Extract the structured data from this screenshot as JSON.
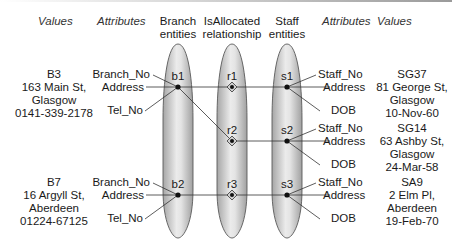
{
  "headers": {
    "left_values": "Values",
    "left_attributes": "Attributes",
    "branch_entities_line1": "Branch",
    "branch_entities_line2": "entities",
    "relationship_line1": "IsAllocated",
    "relationship_line2": "relationship",
    "staff_entities_line1": "Staff",
    "staff_entities_line2": "entities",
    "right_attributes": "Attributes",
    "right_values": "Values"
  },
  "branches": [
    {
      "id": "b1",
      "attributes": [
        "Branch_No",
        "Address",
        "Tel_No"
      ],
      "values": [
        "B3",
        "163 Main St,",
        "Glasgow",
        "0141-339-2178"
      ]
    },
    {
      "id": "b2",
      "attributes": [
        "Branch_No",
        "Address",
        "Tel_No"
      ],
      "values": [
        "B7",
        "16 Argyll St,",
        "Aberdeen",
        "01224-67125"
      ]
    }
  ],
  "relationships": [
    {
      "id": "r1",
      "branch": "b1",
      "staff": "s1"
    },
    {
      "id": "r2",
      "branch": "b1",
      "staff": "s2"
    },
    {
      "id": "r3",
      "branch": "b2",
      "staff": "s3"
    }
  ],
  "staff": [
    {
      "id": "s1",
      "attributes": [
        "Staff_No",
        "Address",
        "DOB"
      ],
      "values": [
        "SG37",
        "81 George St,",
        "Glasgow",
        "10-Nov-60"
      ]
    },
    {
      "id": "s2",
      "attributes": [
        "Staff_No",
        "Address",
        "DOB"
      ],
      "values": [
        "SG14",
        "63 Ashby St,",
        "Glasgow",
        "24-Mar-58"
      ]
    },
    {
      "id": "s3",
      "attributes": [
        "Staff_No",
        "Address",
        "DOB"
      ],
      "values": [
        "SA9",
        "2 Elm Pl,",
        "Aberdeen",
        "19-Feb-70"
      ]
    }
  ],
  "colors": {
    "ellipse_fill_center": "#f2f2f2",
    "ellipse_fill_edge": "#a8a8a8",
    "ellipse_stroke": "#555555",
    "line": "#333333",
    "node": "#111111"
  }
}
